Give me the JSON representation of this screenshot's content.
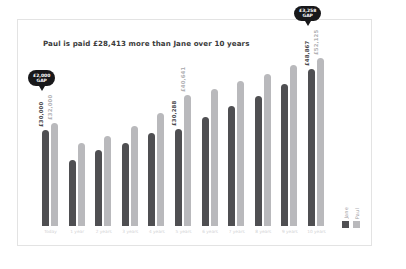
{
  "chart_data": {
    "type": "bar",
    "title": "Paul is paid £28,413 more than Jane over 10 years",
    "xlabel": "",
    "ylabel": "",
    "ylim": [
      0,
      56000
    ],
    "grid": false,
    "legend_position": "bottom-right",
    "categories": [
      "Today",
      "1 year",
      "2 years",
      "3 years",
      "4 years",
      "5 years",
      "6 years",
      "7 years",
      "8 years",
      "9 years",
      "10 years"
    ],
    "series": [
      {
        "name": "Jane",
        "color": "#4f4f52",
        "values": [
          30000,
          20400,
          23600,
          25800,
          28900,
          30288,
          33900,
          37200,
          40600,
          44300,
          48867
        ]
      },
      {
        "name": "Paul",
        "color": "#b9b9bc",
        "values": [
          32000,
          25800,
          27900,
          31200,
          35100,
          40641,
          42700,
          45100,
          47200,
          50100,
          52125
        ]
      }
    ],
    "value_labels": [
      {
        "index": 0,
        "jane": "£30,000",
        "paul": "£32,000"
      },
      {
        "index": 5,
        "jane": "£30,288",
        "paul": "£40,641"
      },
      {
        "index": 10,
        "jane": "£48,867",
        "paul": "£52,125"
      }
    ],
    "annotations": [
      {
        "name": "gap-start",
        "line1": "£2,000",
        "line2": "GAP",
        "index": 0
      },
      {
        "name": "gap-end",
        "line1": "£3,258",
        "line2": "GAP",
        "index": 10
      }
    ]
  },
  "legend": {
    "items": [
      {
        "label": "Jane"
      },
      {
        "label": "Paul"
      }
    ]
  }
}
